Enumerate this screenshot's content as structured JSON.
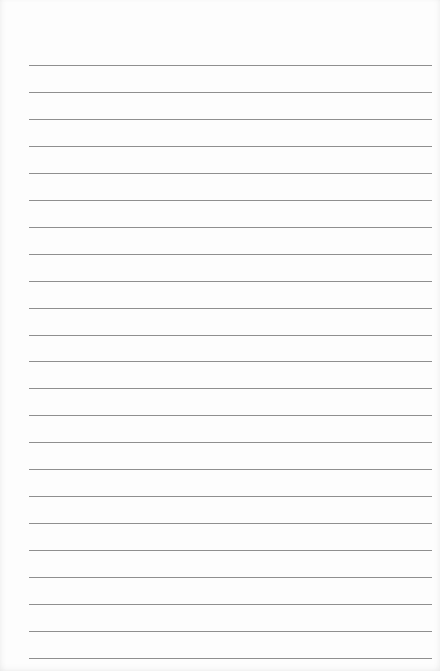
{
  "document": {
    "type": "lined-paper",
    "line_count": 23,
    "line_color": "#8f8f8f",
    "paper_color": "#fdfdfd",
    "text_lines": []
  }
}
